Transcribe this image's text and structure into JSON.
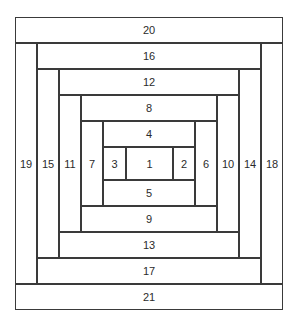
{
  "diagram": {
    "type": "log-cabin-quilt-block",
    "stroke_color": "#3a3a3a",
    "fill_color": "#ffffff",
    "text_color": "#2b2b2b",
    "piece_count": 21,
    "pieces": [
      {
        "label": "1",
        "orientation": "center",
        "x": 126,
        "y": 147,
        "w": 47,
        "h": 33
      },
      {
        "label": "2",
        "orientation": "vertical",
        "x": 173,
        "y": 147,
        "w": 22,
        "h": 33
      },
      {
        "label": "3",
        "orientation": "vertical",
        "x": 103,
        "y": 147,
        "w": 23,
        "h": 33
      },
      {
        "label": "4",
        "orientation": "horizontal",
        "x": 103,
        "y": 121,
        "w": 92,
        "h": 26
      },
      {
        "label": "5",
        "orientation": "horizontal",
        "x": 103,
        "y": 180,
        "w": 92,
        "h": 26
      },
      {
        "label": "6",
        "orientation": "vertical",
        "x": 195,
        "y": 121,
        "w": 22,
        "h": 85
      },
      {
        "label": "7",
        "orientation": "vertical",
        "x": 81,
        "y": 121,
        "w": 22,
        "h": 85
      },
      {
        "label": "8",
        "orientation": "horizontal",
        "x": 81,
        "y": 95,
        "w": 136,
        "h": 26
      },
      {
        "label": "9",
        "orientation": "horizontal",
        "x": 81,
        "y": 206,
        "w": 136,
        "h": 26
      },
      {
        "label": "10",
        "orientation": "vertical",
        "x": 217,
        "y": 95,
        "w": 22,
        "h": 137
      },
      {
        "label": "11",
        "orientation": "vertical",
        "x": 59,
        "y": 95,
        "w": 22,
        "h": 137
      },
      {
        "label": "12",
        "orientation": "horizontal",
        "x": 59,
        "y": 69,
        "w": 180,
        "h": 26
      },
      {
        "label": "13",
        "orientation": "horizontal",
        "x": 59,
        "y": 232,
        "w": 180,
        "h": 26
      },
      {
        "label": "14",
        "orientation": "vertical",
        "x": 239,
        "y": 69,
        "w": 22,
        "h": 189
      },
      {
        "label": "15",
        "orientation": "vertical",
        "x": 37,
        "y": 69,
        "w": 22,
        "h": 189
      },
      {
        "label": "16",
        "orientation": "horizontal",
        "x": 37,
        "y": 43,
        "w": 224,
        "h": 26
      },
      {
        "label": "17",
        "orientation": "horizontal",
        "x": 37,
        "y": 258,
        "w": 224,
        "h": 26
      },
      {
        "label": "18",
        "orientation": "vertical",
        "x": 261,
        "y": 43,
        "w": 22,
        "h": 241
      },
      {
        "label": "19",
        "orientation": "vertical",
        "x": 15,
        "y": 43,
        "w": 22,
        "h": 241
      },
      {
        "label": "20",
        "orientation": "horizontal",
        "x": 15,
        "y": 17,
        "w": 268,
        "h": 26
      },
      {
        "label": "21",
        "orientation": "horizontal",
        "x": 15,
        "y": 284,
        "w": 268,
        "h": 26
      }
    ]
  }
}
